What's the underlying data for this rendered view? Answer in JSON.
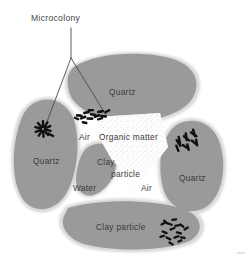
{
  "figure": {
    "type": "soil-microstructure-diagram",
    "background_color": "#ffffff",
    "particle_color": "#9a9a9a",
    "pore_color": "#ffffff",
    "ink_color": "#3a3a3a",
    "microbe_color": "#111111"
  },
  "callout": {
    "title": "Microcolony",
    "leader_apex": "71,58",
    "branch_left_end": "44,126",
    "branch_right_end": "105,114"
  },
  "labels": {
    "quartz_top": "Quartz",
    "quartz_left": "Quartz",
    "quartz_right": "Quartz",
    "clay_center_line1": "Clay",
    "clay_center_line2": "particle",
    "clay_bottom": "Clay particle",
    "organic_matter": "Organic matter",
    "air_left": "Air",
    "air_right": "Air",
    "water": "Water"
  },
  "regions": [
    {
      "name": "quartz-grain-top",
      "material": "Quartz",
      "fill": "#9a9a9a"
    },
    {
      "name": "quartz-grain-left",
      "material": "Quartz",
      "fill": "#9a9a9a"
    },
    {
      "name": "quartz-grain-right",
      "material": "Quartz",
      "fill": "#9a9a9a"
    },
    {
      "name": "clay-particle-center",
      "material": "Clay particle",
      "fill": "#9a9a9a"
    },
    {
      "name": "clay-particle-bottom",
      "material": "Clay particle",
      "fill": "#9a9a9a"
    },
    {
      "name": "organic-matter",
      "material": "Organic matter",
      "fill": "#ffffff"
    },
    {
      "name": "pore-air-left",
      "material": "Air",
      "fill": "#ffffff"
    },
    {
      "name": "pore-air-right",
      "material": "Air",
      "fill": "#ffffff"
    },
    {
      "name": "pore-water",
      "material": "Water",
      "fill": "#ffffff"
    }
  ],
  "microcolonies": [
    {
      "name": "microcolony-left",
      "pattern": "radial-starburst",
      "cells": 11
    },
    {
      "name": "microcolony-center-top",
      "pattern": "horizontal-band",
      "cells": 13
    },
    {
      "name": "microcolony-right",
      "pattern": "herringbone",
      "cells": 11
    },
    {
      "name": "microcolony-bottom-right",
      "pattern": "scattered-swarm",
      "cells": 16
    }
  ]
}
